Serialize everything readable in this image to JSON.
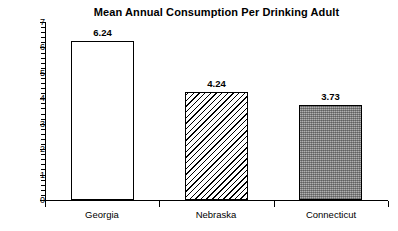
{
  "chart_data": {
    "type": "bar",
    "title": "Mean Annual Consumption Per Drinking Adult",
    "subtitle": "",
    "xlabel": "",
    "ylabel": "",
    "categories": [
      "Georgia",
      "Nebraska",
      "Connecticut"
    ],
    "values": [
      6.24,
      4.24,
      3.73
    ],
    "data_labels": [
      "6.24",
      "4.24",
      "3.73"
    ],
    "ylim": [
      0,
      7
    ],
    "y_major_ticks": [
      0,
      1,
      2,
      3,
      4,
      5,
      6,
      7
    ],
    "y_tick_labels": [
      "0",
      "1",
      "2",
      "3",
      "4",
      "5",
      "6",
      "7"
    ],
    "y_minor_tick_interval": 0.2,
    "grid": false,
    "legend": false,
    "legend_position": "none",
    "bar_styles": [
      {
        "category": "Georgia",
        "fill": "none",
        "edge": "#000000"
      },
      {
        "category": "Nebraska",
        "fill": "diagonal-hatch",
        "edge": "#000000"
      },
      {
        "category": "Connecticut",
        "fill": "gray-stipple",
        "edge": "#000000"
      }
    ]
  },
  "colors": {
    "background": "#ffffff",
    "axis": "#000000",
    "text": "#000000",
    "stipple_gray": "#8a8a8a"
  }
}
